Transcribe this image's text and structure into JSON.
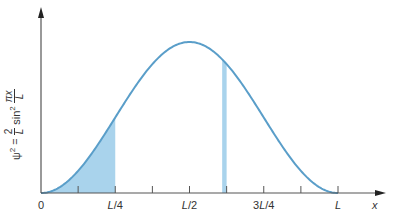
{
  "chart_data": {
    "type": "area",
    "title": "",
    "function": "psi^2 = (2/L) sin^2(pi x / L)",
    "xlabel": "x",
    "ylabel": "ψ² = (2/L) sin² (πx/L)",
    "ylabel_parts": {
      "lhs": "ψ",
      "exp": "2",
      "eq": "=",
      "num": "2",
      "den": "L",
      "fn": "sin",
      "fn_exp": "2",
      "arg_num": "πx",
      "arg_den": "L"
    },
    "xticks": [
      "0",
      "L/4",
      "L/2",
      "3L/4",
      "L"
    ],
    "xtick_positions_fraction_of_L": [
      0,
      0.25,
      0.5,
      0.75,
      1.0
    ],
    "minor_ticks_fraction_of_L": [
      0.125,
      0.375,
      0.625,
      0.875
    ],
    "x": [
      0,
      0.1,
      0.2,
      0.25,
      0.3,
      0.4,
      0.5,
      0.6,
      0.7,
      0.75,
      0.8,
      0.9,
      1.0
    ],
    "values": [
      0,
      0.0955,
      0.3455,
      0.5,
      0.6545,
      0.9045,
      1.0,
      0.9045,
      0.6545,
      0.5,
      0.3455,
      0.0955,
      0
    ],
    "values_unit": "fraction of max (2/L)",
    "shaded_regions": [
      {
        "from": 0,
        "to": 0.25,
        "label": "probability 0 to L/4"
      },
      {
        "from": 0.61,
        "to": 0.625,
        "label": "thin strip dx"
      }
    ],
    "grid": false,
    "legend": null,
    "colors": {
      "curve": "#5a9ec9",
      "fill": "#a9d3ec",
      "axis": "#555555"
    }
  }
}
